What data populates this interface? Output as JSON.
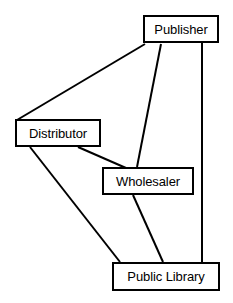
{
  "diagram": {
    "type": "node-link-diagram",
    "background_color": "#ffffff",
    "line_color": "#000000",
    "box_border_color": "#000000",
    "box_fill_color": "#ffffff",
    "nodes": [
      {
        "id": "publisher",
        "label": "Publisher",
        "x": 143,
        "y": 15,
        "width": 76,
        "height": 28
      },
      {
        "id": "distributor",
        "label": "Distributor",
        "x": 15,
        "y": 119,
        "width": 86,
        "height": 28
      },
      {
        "id": "wholesaler",
        "label": "Wholesaler",
        "x": 102,
        "y": 167,
        "width": 92,
        "height": 28
      },
      {
        "id": "public-library",
        "label": "Public Library",
        "x": 112,
        "y": 262,
        "width": 108,
        "height": 29
      }
    ],
    "edges": [
      {
        "id": "publisher-distributor",
        "from": "publisher",
        "to": "distributor",
        "x1": 145,
        "y1": 44,
        "x2": 17,
        "y2": 120
      },
      {
        "id": "publisher-wholesaler",
        "from": "publisher",
        "to": "wholesaler",
        "x1": 161,
        "y1": 44,
        "x2": 137,
        "y2": 167
      },
      {
        "id": "publisher-public-library",
        "from": "publisher",
        "to": "public-library",
        "x1": 202,
        "y1": 43,
        "x2": 202,
        "y2": 262
      },
      {
        "id": "distributor-wholesaler",
        "from": "distributor",
        "to": "wholesaler",
        "x1": 78,
        "y1": 147,
        "x2": 126,
        "y2": 168
      },
      {
        "id": "distributor-public-library",
        "from": "distributor",
        "to": "public-library",
        "x1": 30,
        "y1": 147,
        "x2": 120,
        "y2": 262
      },
      {
        "id": "wholesaler-public-library",
        "from": "wholesaler",
        "to": "public-library",
        "x1": 133,
        "y1": 195,
        "x2": 163,
        "y2": 262
      }
    ]
  }
}
